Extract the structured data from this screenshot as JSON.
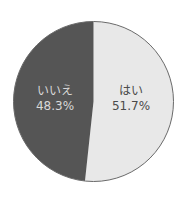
{
  "chart_data": {
    "type": "pie",
    "title": "",
    "categories": [
      "はい",
      "いいえ"
    ],
    "values": [
      51.7,
      48.3
    ],
    "unit": "%",
    "start_angle": "12 o'clock, clockwise",
    "colors": [
      "#e8e8e8",
      "#555555"
    ],
    "legend": "none (labels inside slices)",
    "labels": [
      {
        "name": "はい",
        "percent": "51.7%"
      },
      {
        "name": "いいえ",
        "percent": "48.3%"
      }
    ]
  },
  "style": {
    "outline_color": "#6a6a6a",
    "yes_color": "#e8e8e8",
    "no_color": "#555555"
  }
}
